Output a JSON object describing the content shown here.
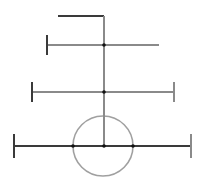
{
  "diagram": {
    "canvas": {
      "width": 205,
      "height": 191,
      "background": "#ffffff"
    },
    "stroke_color": "#3a3a3a",
    "light_stroke_color": "#8a8a8a",
    "circle_color": "#a0a0a0",
    "dot_color": "#111111",
    "mast": {
      "x": 104,
      "y1": 16,
      "y2": 146
    },
    "top_flag": {
      "x1": 58,
      "x2": 104,
      "y": 16
    },
    "bars": [
      {
        "name": "upper-bar",
        "y": 45,
        "x1": 47,
        "x2": 159,
        "left_tick": true,
        "right_tick": false,
        "tick_half": 10
      },
      {
        "name": "middle-bar",
        "y": 92,
        "x1": 32,
        "x2": 174,
        "left_tick": true,
        "right_tick": true,
        "tick_half": 10
      },
      {
        "name": "base-bar",
        "y": 146,
        "x1": 14,
        "x2": 191,
        "left_tick": true,
        "right_tick": true,
        "tick_half": 12
      }
    ],
    "circle": {
      "cx": 103,
      "cy": 146,
      "r": 30
    },
    "dots": [
      {
        "x": 104,
        "y": 45
      },
      {
        "x": 104,
        "y": 92
      },
      {
        "x": 104,
        "y": 146
      },
      {
        "x": 73,
        "y": 146
      },
      {
        "x": 133,
        "y": 146
      }
    ]
  }
}
